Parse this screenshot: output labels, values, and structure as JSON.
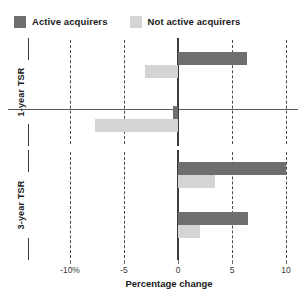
{
  "legend": {
    "items": [
      {
        "label": "Active acquirers",
        "color": "#6e6e6e",
        "icon": "legend-swatch-icon"
      },
      {
        "label": "Not active acquirers",
        "color": "#d4d4d4",
        "icon": "legend-swatch-icon"
      }
    ]
  },
  "axis": {
    "title": "Percentage change",
    "ticks": [
      {
        "value": -10,
        "label": "-10%"
      },
      {
        "value": -5,
        "label": "-5"
      },
      {
        "value": 0,
        "label": "0"
      },
      {
        "value": 5,
        "label": "5"
      },
      {
        "value": 10,
        "label": "10"
      }
    ]
  },
  "panels": [
    {
      "title": "1-year TSR",
      "groups": [
        {
          "label_line1": "Average",
          "label_line2": "growth"
        },
        {
          "label_line1": "Median",
          "label_line2": "growth"
        }
      ]
    },
    {
      "title": "3-year TSR",
      "groups": [
        {
          "label_line1": "Average",
          "label_line2": "growth"
        },
        {
          "label_line1": "Median",
          "label_line2": "growth"
        }
      ]
    }
  ],
  "chart_data": {
    "type": "bar",
    "orientation": "horizontal",
    "title": "",
    "xlabel": "Percentage change",
    "ylabel": "",
    "xlim": [
      -12,
      11
    ],
    "xticks": [
      -10,
      -5,
      0,
      5,
      10
    ],
    "xticklabels": [
      "-10%",
      "-5",
      "0",
      "5",
      "10"
    ],
    "grid": "vertical-dashed",
    "legend_position": "top-left",
    "panels": [
      {
        "name": "1-year TSR",
        "categories": [
          "Average growth",
          "Median growth"
        ],
        "series": [
          {
            "name": "Active acquirers",
            "color": "#6e6e6e",
            "values": [
              6.4,
              -0.5
            ]
          },
          {
            "name": "Not active acquirers",
            "color": "#d4d4d4",
            "values": [
              -3.1,
              -7.7
            ]
          }
        ]
      },
      {
        "name": "3-year TSR",
        "categories": [
          "Average growth",
          "Median growth"
        ],
        "series": [
          {
            "name": "Active acquirers",
            "color": "#6e6e6e",
            "values": [
              10.0,
              6.5
            ]
          },
          {
            "name": "Not active acquirers",
            "color": "#d4d4d4",
            "values": [
              3.4,
              2.0
            ]
          }
        ]
      }
    ]
  }
}
